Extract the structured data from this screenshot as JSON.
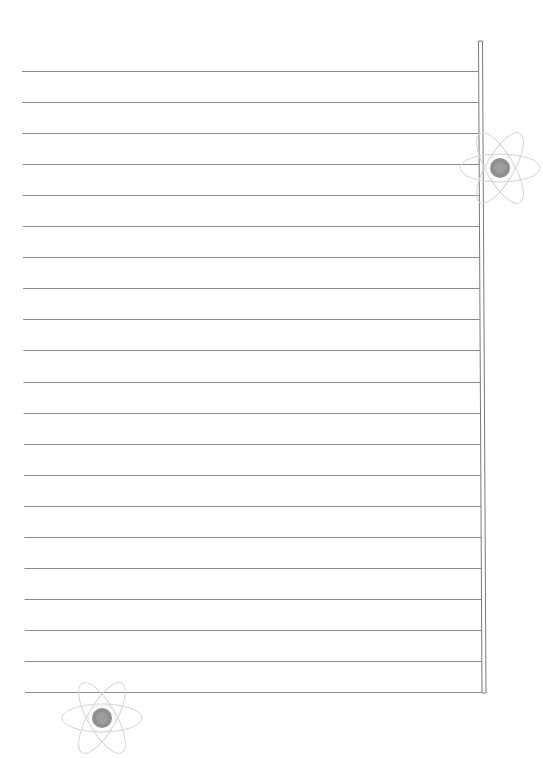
{
  "page": {
    "type": "ruled-notebook-page",
    "line_count": 21,
    "text_content": "",
    "colors": {
      "background": "#ffffff",
      "rule_line": "#8a8a8a",
      "margin_bar": "#7a7a7a",
      "motif_outline": "#d6d6d6",
      "motif_center": "#8f8f8f"
    }
  },
  "decorations": [
    {
      "name": "atom-motif-top-right",
      "icon": "atom-icon"
    },
    {
      "name": "atom-motif-bottom-left",
      "icon": "atom-icon"
    }
  ]
}
